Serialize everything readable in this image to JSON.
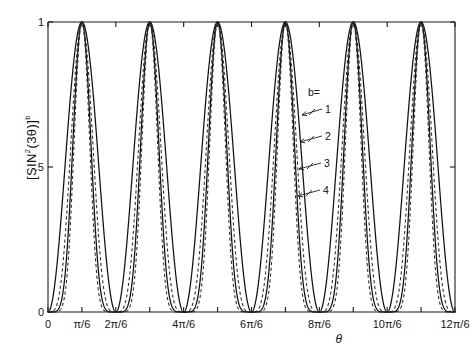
{
  "chart_data": {
    "type": "line",
    "title": "",
    "ylabel": "[SIN²(3θ)]ᵇ",
    "ylabel_parts": {
      "open": "[SIN",
      "exp2": "2",
      "arg": "(3θ)]",
      "expb": "b"
    },
    "xlabel": "θ",
    "xlim": [
      0,
      6.283185307179586
    ],
    "ylim": [
      0,
      1
    ],
    "grid": false,
    "legend_position": "inside-right",
    "legend_title": "b=",
    "x_tick_values": [
      0,
      0.5235987755982988,
      1.0471975511965976,
      1.5707963267948966,
      2.0943951023931953,
      2.6179938779914944,
      3.141592653589793,
      3.665191429188092,
      4.188790204786391,
      4.71238898038469,
      5.235987755982989,
      5.759586531581287,
      6.283185307179586
    ],
    "x_tick_labels": [
      "0",
      "π/6",
      "2π/6",
      "",
      "4π/6",
      "",
      "6π/6",
      "",
      "8π/6",
      "",
      "10π/6",
      "",
      "12π/6"
    ],
    "y_tick_values": [
      0,
      0.5,
      1
    ],
    "y_tick_labels": [
      "0",
      ".5",
      "1"
    ],
    "function": "[sin^2(3*theta)]^b",
    "n_peaks": 6,
    "series": [
      {
        "name": "1",
        "b": 1,
        "style": "solid",
        "label": "1"
      },
      {
        "name": "2",
        "b": 2,
        "style": "dashed",
        "label": "2"
      },
      {
        "name": "3",
        "b": 3,
        "style": "solid",
        "label": "3"
      },
      {
        "name": "4",
        "b": 4,
        "style": "dashed",
        "label": "4"
      }
    ],
    "annotations": [
      {
        "label": "1",
        "points_to_series": "1"
      },
      {
        "label": "2",
        "points_to_series": "2"
      },
      {
        "label": "3",
        "points_to_series": "3"
      },
      {
        "label": "4",
        "points_to_series": "4"
      }
    ],
    "colors": {
      "curve": "#111111",
      "axis": "#1a1a1a"
    }
  },
  "axes": {
    "y_ticks": [
      {
        "label": "1",
        "value": 1
      },
      {
        "label": ".5",
        "value": 0.5
      },
      {
        "label": "0",
        "value": 0
      }
    ],
    "x_ticks": [
      {
        "label": "0",
        "value": 0
      },
      {
        "label": "π/6",
        "value": 0.5235987755982988
      },
      {
        "label": "2π/6",
        "value": 1.0471975511965976
      },
      {
        "label": "4π/6",
        "value": 2.0943951023931953
      },
      {
        "label": "6π/6",
        "value": 3.141592653589793
      },
      {
        "label": "8π/6",
        "value": 4.188790204786391
      },
      {
        "label": "10π/6",
        "value": 5.235987755982989
      },
      {
        "label": "12π/6",
        "value": 6.283185307179586
      }
    ],
    "x_axis_title": "θ"
  },
  "legend": {
    "title": "b=",
    "items": [
      {
        "label": "1"
      },
      {
        "label": "2"
      },
      {
        "label": "3"
      },
      {
        "label": "4"
      }
    ]
  }
}
